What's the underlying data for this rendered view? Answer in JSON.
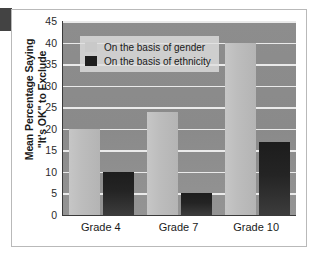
{
  "chart_data": {
    "type": "bar",
    "title": "",
    "xlabel": "",
    "ylabel_line1": "Mean Percentage Saying",
    "ylabel_line2": "\"It's OK\" to Exclude",
    "categories": [
      "Grade 4",
      "Grade 7",
      "Grade 10"
    ],
    "series": [
      {
        "name": "On the basis of gender",
        "color": "#c2c2c2",
        "values": [
          20,
          24,
          40
        ]
      },
      {
        "name": "On the basis of ethnicity",
        "color": "#1e1e1e",
        "values": [
          10,
          5,
          17
        ]
      }
    ],
    "ylim": [
      0,
      45
    ],
    "yticks": [
      0,
      5,
      10,
      15,
      20,
      25,
      30,
      35,
      40,
      45
    ],
    "ytick_labels": [
      "0",
      "5",
      "10",
      "15",
      "20",
      "25",
      "30",
      "35",
      "40",
      "45"
    ],
    "grid": true,
    "grid_color": "#f2f2f2",
    "legend_position": "upper-left-inside",
    "plot_background": "#8a8a8a"
  }
}
